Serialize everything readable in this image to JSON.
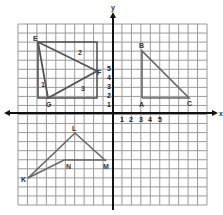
{
  "axes": {
    "x_label": "x",
    "y_label": "y",
    "x_ticks": [
      "1",
      "2",
      "3",
      "4",
      "5"
    ],
    "y_ticks": [
      "1",
      "2",
      "3",
      "4",
      "5"
    ]
  },
  "colors": {
    "grid": "#9a9a9a",
    "axis": "#111111",
    "shape": "#555555"
  },
  "shapes": {
    "rectangle": {
      "label": "rectangle-around-triangle"
    },
    "triangle_efg": {
      "vertices": [
        "E",
        "F",
        "G"
      ],
      "region_labels": [
        "1",
        "2",
        "3"
      ]
    },
    "triangle_abc": {
      "vertices": [
        "A",
        "B",
        "C"
      ]
    },
    "triangle_klm": {
      "vertices": [
        "K",
        "L",
        "M",
        "N"
      ]
    }
  },
  "chart_data": {
    "type": "diagram",
    "title": "",
    "grid": true,
    "xlim": [
      -10,
      10
    ],
    "ylim": [
      -10,
      10
    ],
    "figures": [
      {
        "name": "Triangle EFG inside rectangle",
        "points": {
          "E": [
            -8,
            8
          ],
          "F": [
            -2,
            4
          ],
          "G": [
            -7,
            2
          ]
        },
        "rectangle": [
          [
            -8,
            8
          ],
          [
            -2,
            8
          ],
          [
            -2,
            2
          ],
          [
            -8,
            2
          ]
        ],
        "regions": [
          "1",
          "2",
          "3"
        ]
      },
      {
        "name": "Triangle ABC",
        "points": {
          "A": [
            3,
            2
          ],
          "B": [
            3,
            7
          ],
          "C": [
            8,
            2
          ]
        }
      },
      {
        "name": "Triangle KLM with N",
        "points": {
          "K": [
            -9,
            -7
          ],
          "L": [
            -1,
            -2
          ],
          "M": [
            2,
            -5
          ],
          "N": [
            -4,
            -5
          ]
        }
      }
    ]
  }
}
